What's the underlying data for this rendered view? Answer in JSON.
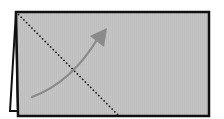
{
  "diagram": {
    "colors": {
      "background": "#ffffff",
      "card_fill": "#c6c6c6",
      "card_stripe": "#bcbcbc",
      "outline": "#111111",
      "fold_line": "#1a1a1a",
      "arrow": "#8a8a8a",
      "back_flap_fill": "#ffffff"
    },
    "card": {
      "points": "16,12 209,12 209,116 18,116"
    },
    "back_flap": {
      "points": "16,12 10,111 18,111"
    },
    "fold_line": {
      "x1": 18,
      "y1": 14,
      "x2": 118,
      "y2": 115,
      "style": "dotted"
    },
    "arrow": {
      "path": "M32,97 Q72,82 98,38",
      "head": "90,36 107,28 104,47",
      "direction": "up-right"
    }
  }
}
